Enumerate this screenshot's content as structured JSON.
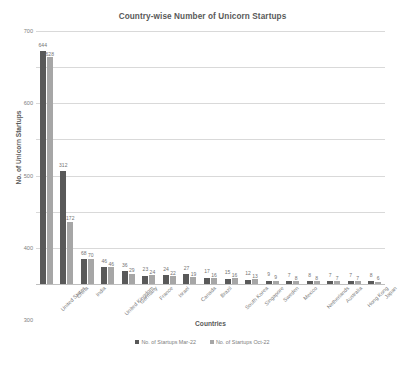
{
  "chart_data": {
    "type": "bar",
    "title": "Country-wise Number of Unicorn Startups",
    "xlabel": "Countries",
    "ylabel": "No. of Unicorn Startups",
    "ylim": [
      0,
      700
    ],
    "yticks": [
      0,
      100,
      200,
      300,
      400,
      500,
      600,
      700
    ],
    "grid": true,
    "legend_position": "bottom",
    "categories": [
      "United States",
      "China",
      "India",
      "United Kingdom",
      "Germany",
      "France",
      "Israel",
      "Canada",
      "Brazil",
      "South Korea",
      "Singapore",
      "Sweden",
      "Mexico",
      "Netherlands",
      "Australia",
      "Hong Kong",
      "Japan"
    ],
    "series": [
      {
        "name": "No. of Startups Mar-22",
        "color": "#595959",
        "values": [
          644,
          312,
          68,
          46,
          36,
          23,
          24,
          27,
          17,
          15,
          12,
          9,
          7,
          8,
          7,
          7,
          8
        ]
      },
      {
        "name": "No. of Startups Oct-22",
        "color": "#a6a6a6",
        "values": [
          628,
          172,
          70,
          46,
          29,
          24,
          22,
          19,
          16,
          16,
          13,
          9,
          8,
          8,
          7,
          7,
          6
        ]
      }
    ]
  },
  "colors": {
    "gridline": "#d9d9d9",
    "axis_text": "#808080",
    "title_text": "#595959",
    "background": "#ffffff"
  }
}
